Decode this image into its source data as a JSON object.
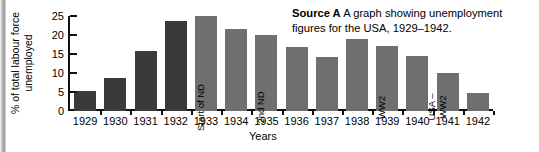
{
  "caption": {
    "source_label": "Source A",
    "text": "A graph showing unemployment figures for the USA, 1929–1942."
  },
  "colors": {
    "bar_dark": "#3a3a3a",
    "bar_light": "#6f6f6f",
    "axis": "#111111",
    "background": "#ffffff"
  },
  "chart_data": {
    "type": "bar",
    "title": "",
    "xlabel": "Years",
    "ylabel": "% of total labour force unemployed",
    "ylabel_lines": [
      "% of total labour force",
      "unemployed"
    ],
    "categories": [
      "1929",
      "1930",
      "1931",
      "1932",
      "1933",
      "1934",
      "1935",
      "1936",
      "1937",
      "1938",
      "1939",
      "1940",
      "1941",
      "1942"
    ],
    "values": [
      5.2,
      8.7,
      15.9,
      23.6,
      24.9,
      21.7,
      20.1,
      16.9,
      14.3,
      19.0,
      17.2,
      14.6,
      9.9,
      4.7
    ],
    "ylim": [
      0,
      25
    ],
    "yticks": [
      0,
      5,
      10,
      15,
      20,
      25
    ],
    "ytick_labels": [
      "0",
      "5",
      "10",
      "15",
      "20",
      "25"
    ],
    "grid": false,
    "legend": false,
    "bar_colors": [
      "dark",
      "dark",
      "dark",
      "dark",
      "light",
      "light",
      "light",
      "light",
      "light",
      "light",
      "light",
      "light",
      "light",
      "light"
    ],
    "annotations": [
      {
        "category": "1933",
        "lines": [
          "Start of ND"
        ]
      },
      {
        "category": "1935",
        "lines": [
          "2nd ND"
        ]
      },
      {
        "category": "1939",
        "lines": [
          "WW2"
        ]
      },
      {
        "category": "1941",
        "lines": [
          "USA –",
          "WW2"
        ]
      }
    ]
  }
}
